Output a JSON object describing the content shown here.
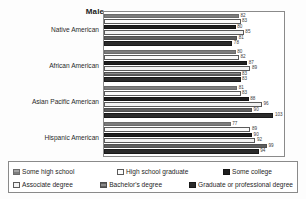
{
  "chart_data": {
    "type": "bar",
    "orientation": "horizontal",
    "title": "Male",
    "xlabel": "",
    "ylabel": "",
    "grid": false,
    "legend_position": "bottom",
    "xlim": [
      0,
      110
    ],
    "categories": [
      "Native American",
      "African American",
      "Asian Pacific American",
      "Hispanic American"
    ],
    "series": [
      {
        "name": "Some high school",
        "values": [
          82,
          80,
          81,
          77
        ]
      },
      {
        "name": "High school graduate",
        "values": [
          83,
          82,
          83,
          89
        ]
      },
      {
        "name": "Some college",
        "values": [
          80,
          87,
          88,
          90
        ]
      },
      {
        "name": "Associate degree",
        "values": [
          85,
          89,
          96,
          92
        ]
      },
      {
        "name": "Bachelor's degree",
        "values": [
          81,
          83,
          90,
          99
        ]
      },
      {
        "name": "Graduate or professional degree",
        "values": [
          78,
          83,
          103,
          94
        ]
      }
    ]
  },
  "legend": {
    "items": [
      {
        "label": "Some high school",
        "swatch": "hatched-gray"
      },
      {
        "label": "High school graduate",
        "swatch": "white"
      },
      {
        "label": "Some college",
        "swatch": "black"
      },
      {
        "label": "Associate degree",
        "swatch": "white"
      },
      {
        "label": "Bachelor's degree",
        "swatch": "hatched-dark-gray"
      },
      {
        "label": "Graduate or professional degree",
        "swatch": "dark"
      }
    ]
  }
}
